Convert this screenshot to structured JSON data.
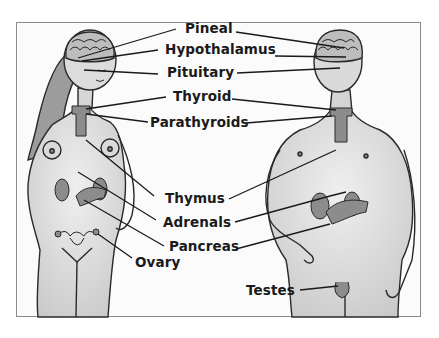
{
  "diagram": {
    "figures": [
      "female",
      "male"
    ],
    "labels": [
      {
        "key": "pineal",
        "text": "Pineal"
      },
      {
        "key": "hypothalamus",
        "text": "Hypothalamus"
      },
      {
        "key": "pituitary",
        "text": "Pituitary"
      },
      {
        "key": "thyroid",
        "text": "Thyroid"
      },
      {
        "key": "parathyroids",
        "text": "Parathyroids"
      },
      {
        "key": "thymus",
        "text": "Thymus"
      },
      {
        "key": "adrenals",
        "text": "Adrenals"
      },
      {
        "key": "pancreas",
        "text": "Pancreas"
      },
      {
        "key": "ovary",
        "text": "Ovary"
      },
      {
        "key": "testes",
        "text": "Testes"
      }
    ],
    "colors": {
      "skin": "#e4e4e4",
      "skin_shade": "#c8c8c8",
      "hair": "#9a9a9a",
      "gland": "#8c8c8c",
      "outline": "#2a2a2a",
      "leader_line": "#1a1a1a",
      "frame_border": "#8a8a8a"
    }
  }
}
